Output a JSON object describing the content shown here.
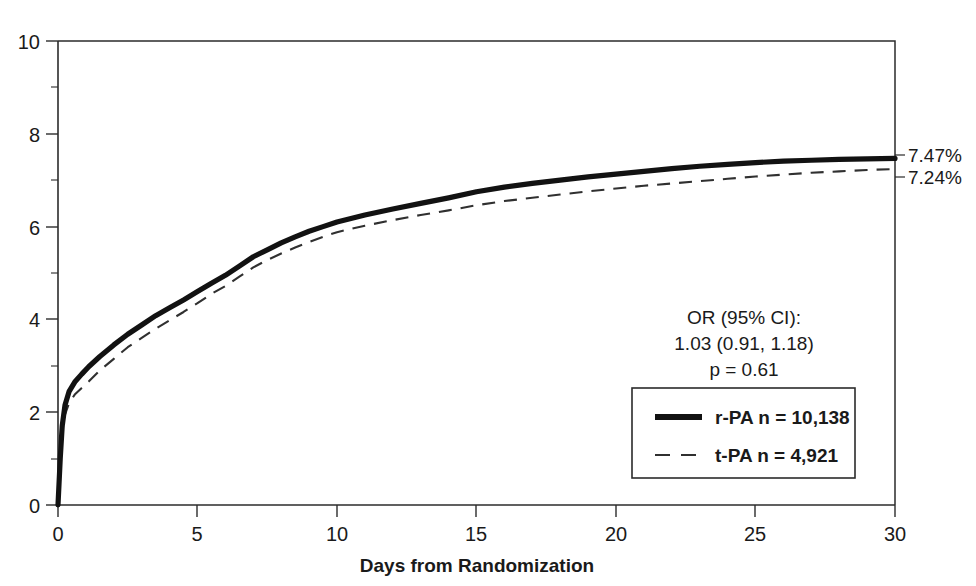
{
  "chart_data": {
    "type": "line",
    "title": "",
    "xlabel": "Days from Randomization",
    "ylabel": "",
    "xlim": [
      0,
      30
    ],
    "ylim": [
      0,
      10
    ],
    "grid": false,
    "xticks": [
      "0",
      "5",
      "10",
      "15",
      "20",
      "25",
      "30"
    ],
    "xtick_values": [
      0,
      5,
      10,
      15,
      20,
      25,
      30
    ],
    "yticks": [
      "0",
      "2",
      "4",
      "6",
      "8",
      "10"
    ],
    "ytick_values": [
      0,
      2,
      4,
      6,
      8,
      10
    ],
    "yminor_values": [
      1,
      3,
      5,
      7,
      9
    ],
    "legend_position": "inside-lower-right",
    "series": [
      {
        "name": "r-PA",
        "style": "solid",
        "n": "10,138",
        "end_label": "7.47%",
        "end_value": 7.47,
        "x": [
          0,
          0.08,
          0.15,
          0.25,
          0.4,
          0.6,
          0.85,
          1.1,
          1.5,
          2,
          2.5,
          3,
          3.5,
          4,
          4.5,
          5,
          5.5,
          6,
          6.5,
          7,
          7.5,
          8,
          8.5,
          9,
          9.5,
          10,
          11,
          12,
          13,
          14,
          15,
          16,
          17,
          18,
          19,
          20,
          21,
          22,
          23,
          24,
          25,
          26,
          27,
          28,
          29,
          30
        ],
        "y": [
          0,
          1.0,
          1.7,
          2.15,
          2.45,
          2.65,
          2.82,
          2.98,
          3.2,
          3.45,
          3.68,
          3.88,
          4.08,
          4.25,
          4.42,
          4.6,
          4.78,
          4.95,
          5.15,
          5.35,
          5.5,
          5.65,
          5.78,
          5.9,
          6.0,
          6.1,
          6.25,
          6.38,
          6.5,
          6.62,
          6.75,
          6.85,
          6.93,
          7.0,
          7.07,
          7.13,
          7.19,
          7.25,
          7.3,
          7.34,
          7.38,
          7.41,
          7.43,
          7.45,
          7.46,
          7.47
        ]
      },
      {
        "name": "t-PA",
        "style": "dashed",
        "n": "4,921",
        "end_label": "7.24%",
        "end_value": 7.24,
        "x": [
          0,
          0.08,
          0.15,
          0.25,
          0.4,
          0.6,
          0.85,
          1.1,
          1.5,
          2,
          2.5,
          3,
          3.5,
          4,
          4.5,
          5,
          5.5,
          6,
          6.5,
          7,
          7.5,
          8,
          8.5,
          9,
          9.5,
          10,
          11,
          12,
          13,
          14,
          15,
          16,
          17,
          18,
          19,
          20,
          21,
          22,
          23,
          24,
          25,
          26,
          27,
          28,
          29,
          30
        ],
        "y": [
          0,
          0.9,
          1.55,
          1.95,
          2.2,
          2.38,
          2.52,
          2.66,
          2.9,
          3.15,
          3.4,
          3.6,
          3.8,
          3.98,
          4.16,
          4.35,
          4.55,
          4.72,
          4.92,
          5.12,
          5.28,
          5.42,
          5.55,
          5.67,
          5.78,
          5.88,
          6.02,
          6.14,
          6.25,
          6.35,
          6.46,
          6.55,
          6.62,
          6.69,
          6.76,
          6.82,
          6.88,
          6.93,
          6.98,
          7.03,
          7.08,
          7.12,
          7.16,
          7.19,
          7.22,
          7.24
        ]
      }
    ],
    "annotations": {
      "or_label": "OR (95% CI):",
      "or_value": "1.03 (0.91, 1.18)",
      "p_value": "p = 0.61"
    },
    "legend_entries": [
      {
        "label": "r-PA  n = 10,138",
        "style": "solid"
      },
      {
        "label": "t-PA  n = 4,921",
        "style": "dashed"
      }
    ],
    "colors": {
      "axis": "#2b2b2b",
      "series_solid": "#121212",
      "series_dashed": "#303030",
      "background": "#ffffff"
    }
  }
}
